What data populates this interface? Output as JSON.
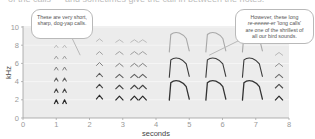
{
  "top_text": "of the calls — and sometimes give the call in between the notes.",
  "chart_data": {
    "type": "spectrogram",
    "title": "",
    "xlabel": "seconds",
    "ylabel": "kHz",
    "xlim": [
      0,
      8
    ],
    "ylim": [
      0,
      10
    ],
    "x_ticks": [
      "0",
      "1",
      "2",
      "3",
      "4",
      "5",
      "6",
      "7",
      "8"
    ],
    "y_ticks": [
      "0",
      "2",
      "4",
      "6",
      "8",
      "10"
    ],
    "grid": "horizontal, every 2 kHz",
    "colors": {
      "plot_bg": "#ececec",
      "grid": "#f8f8f8",
      "axis": "#9e9e9e",
      "mark_dark": "#2a2a2a",
      "mark_light": "#a8a8a8"
    },
    "series": [
      {
        "name": "short dog-yap calls",
        "call_times_s": [
          1.0,
          1.25
        ],
        "harmonics_khz": [
          2,
          3.2,
          4.4,
          5.6,
          6.8,
          8
        ],
        "duration_s": 0.06
      },
      {
        "name": "short calls group 2",
        "call_times_s": [
          2.3
        ],
        "harmonics_khz": [
          2.5,
          3.7,
          4.9,
          6.1,
          7.3,
          8.7
        ],
        "duration_s": 0.1
      },
      {
        "name": "short calls group 3",
        "call_times_s": [
          2.9,
          3.35,
          3.6
        ],
        "harmonics_khz": [
          2.4,
          3.6,
          4.8,
          6.0,
          7.3,
          8.6
        ],
        "duration_s": 0.12
      },
      {
        "name": "long calls (re-eeeee-er)",
        "call_times_s": [
          4.4,
          5.5,
          6.6
        ],
        "duration_s": 0.6,
        "harmonics_khz": [
          4.1,
          6.6,
          9.4
        ]
      },
      {
        "name": "short call final",
        "call_times_s": [
          7.7
        ],
        "harmonics_khz": [
          2.4,
          3.7,
          4.8,
          6.0,
          7.2
        ],
        "duration_s": 0.12
      }
    ],
    "annotations": [
      {
        "text": "These are very short, sharp, dog-yap calls.",
        "points_to_s": 1.7,
        "points_to_khz": 6.8
      },
      {
        "text": "However, these long re-eeeee-er 'long calls' are one of the shrillest of all our bird sounds.",
        "points_to_s": 5.6,
        "points_to_khz": 6.9
      }
    ]
  },
  "callouts": {
    "short": {
      "text": "These are very short, sharp, dog-yap calls."
    },
    "long": {
      "line1": "However, these long",
      "line2_italic": "re-eeeee-er",
      "line2_rest": " 'long calls'",
      "line3": "are one of the shrillest of",
      "line4": "all our bird sounds."
    }
  }
}
